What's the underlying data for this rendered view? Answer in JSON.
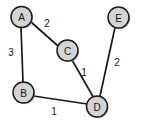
{
  "figure": {
    "title": "",
    "background_color": "#ffffff",
    "width": 141,
    "height": 130
  },
  "style": {
    "node_fill": "#d4d4d4",
    "node_stroke": "#1a1a1a",
    "edge_stroke": "#1a1a1a",
    "label_color": "#141414"
  },
  "graph": {
    "type": "weighted-undirected-graph",
    "nodes": [
      {
        "id": "A",
        "label": "A",
        "cx": 21.5,
        "cy": 17,
        "r": 10.5
      },
      {
        "id": "B",
        "label": "B",
        "cx": 23.5,
        "cy": 92.5,
        "r": 10.5
      },
      {
        "id": "C",
        "label": "C",
        "cx": 67.5,
        "cy": 50.5,
        "r": 10.5
      },
      {
        "id": "D",
        "label": "D",
        "cx": 97,
        "cy": 106.5,
        "r": 10.5
      },
      {
        "id": "E",
        "label": "E",
        "cx": 118.5,
        "cy": 17.5,
        "r": 10.5
      }
    ],
    "edges": [
      {
        "id": "A-C",
        "from": "A",
        "to": "C",
        "weight": "2",
        "x1": 31,
        "y1": 22,
        "x2": 58,
        "y2": 46,
        "label_x": 47,
        "label_y": 23
      },
      {
        "id": "A-B",
        "from": "A",
        "to": "B",
        "weight": "3",
        "x1": 21,
        "y1": 27.5,
        "x2": 23,
        "y2": 82,
        "label_x": 11,
        "label_y": 52
      },
      {
        "id": "C-D",
        "from": "C",
        "to": "D",
        "weight": "1",
        "x1": 72,
        "y1": 60,
        "x2": 93,
        "y2": 96.5,
        "label_x": 84,
        "label_y": 72
      },
      {
        "id": "E-D",
        "from": "E",
        "to": "D",
        "weight": "2",
        "x1": 115,
        "y1": 27.5,
        "x2": 100,
        "y2": 96,
        "label_x": 117,
        "label_y": 62
      },
      {
        "id": "B-D",
        "from": "B",
        "to": "D",
        "weight": "1",
        "x1": 33.5,
        "y1": 96,
        "x2": 87,
        "y2": 104,
        "label_x": 54,
        "label_y": 111
      }
    ]
  }
}
